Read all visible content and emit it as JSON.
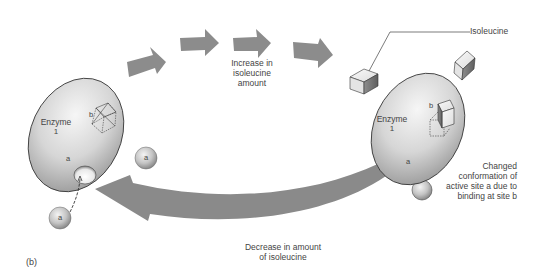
{
  "figure": {
    "panel_label": "(b)",
    "top_arrow_label": [
      "Increase in",
      "isoleucine",
      "amount"
    ],
    "bottom_arrow_label": [
      "Decrease in amount",
      "of isoleucine"
    ],
    "isoleucine_label": "Isoleucine",
    "conformation_note": [
      "Changed",
      "conformation of",
      "active site a due to",
      "binding at site b"
    ],
    "left_enzyme": {
      "name_line1": "Enzyme",
      "name_line2": "1",
      "site_b": "b",
      "site_a": "a"
    },
    "right_enzyme": {
      "name_line1": "Enzyme",
      "name_line2": "1",
      "site_b": "b",
      "site_a": "a"
    },
    "substrate_label": "a",
    "colors": {
      "arrow": "#8c8c8c",
      "enzyme_fill_light": "#f2f2f2",
      "enzyme_fill_dark": "#a8a8a8",
      "outline": "#333333",
      "text": "#444444"
    }
  }
}
